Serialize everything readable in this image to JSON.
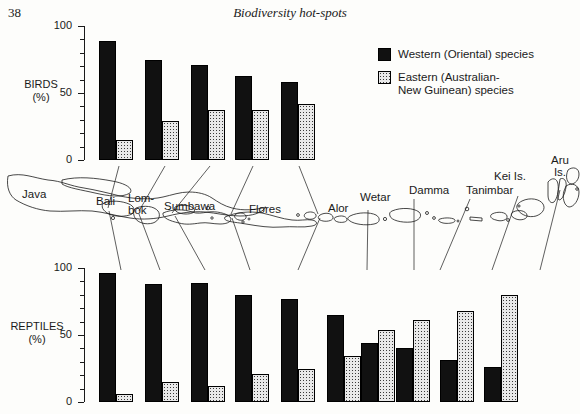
{
  "page": {
    "number": "38",
    "running_head": "Biodiversity hot-spots"
  },
  "legend": {
    "items": [
      {
        "key": "west",
        "label": "Western (Oriental) species",
        "swatch": "solid-black"
      },
      {
        "key": "east",
        "label": "Eastern (Australian-\nNew Guinean) species",
        "swatch": "stippled-grey"
      }
    ]
  },
  "axes": {
    "birds_title": "BIRDS\n(%)",
    "reptiles_title": "REPTILES\n(%)",
    "ticks": [
      "0",
      "50",
      "100"
    ]
  },
  "map": {
    "labels": [
      {
        "name": "Java",
        "text": "Java"
      },
      {
        "name": "Bali",
        "text": "Bali"
      },
      {
        "name": "Lombok",
        "text": "Lom-\nbok"
      },
      {
        "name": "Sumbawa",
        "text": "Sumbawa"
      },
      {
        "name": "Flores",
        "text": "Flores"
      },
      {
        "name": "Alor",
        "text": "Alor"
      },
      {
        "name": "Wetar",
        "text": "Wetar"
      },
      {
        "name": "Damma",
        "text": "Damma"
      },
      {
        "name": "Tanimbar",
        "text": "Tanimbar"
      },
      {
        "name": "Kei",
        "text": "Kei Is."
      },
      {
        "name": "Aru",
        "text": "Aru\nIs."
      }
    ]
  },
  "chart_data": [
    {
      "type": "bar",
      "name": "birds",
      "title": "BIRDS (%)",
      "xlabel": "",
      "ylabel": "BIRDS (%)",
      "ylim": [
        0,
        100
      ],
      "yticks": [
        0,
        50,
        100
      ],
      "grid": false,
      "legend_position": "top-right",
      "categories": [
        "Java",
        "Bali",
        "Lombok",
        "Sumbawa",
        "Flores"
      ],
      "series": [
        {
          "name": "Western (Oriental) species",
          "values": [
            89,
            75,
            71,
            63,
            58
          ]
        },
        {
          "name": "Eastern (Australian-New Guinean) species",
          "values": [
            15,
            29,
            37,
            37,
            42
          ]
        }
      ]
    },
    {
      "type": "bar",
      "name": "reptiles",
      "title": "REPTILES (%)",
      "xlabel": "",
      "ylabel": "REPTILES (%)",
      "ylim": [
        0,
        100
      ],
      "yticks": [
        0,
        50,
        100
      ],
      "grid": false,
      "legend_position": "none",
      "categories": [
        "Java",
        "Bali",
        "Lombok",
        "Sumbawa",
        "Flores",
        "Alor",
        "Wetar",
        "Damma",
        "Tanimbar",
        "Kei Is.",
        "Aru Is."
      ],
      "series": [
        {
          "name": "Western (Oriental) species",
          "values": [
            96,
            88,
            89,
            80,
            77,
            65,
            44,
            40,
            31,
            26
          ]
        },
        {
          "name": "Eastern (Australian-New Guinean) species",
          "values": [
            6,
            15,
            12,
            21,
            25,
            34,
            54,
            61,
            68,
            80
          ]
        }
      ],
      "note": "Ten bar groups plotted; bars correspond left-to-right to Java, Bali, Lombok, Sumbawa, Flores, Wetar, Damma, Tanimbar, Kei Is., Aru Is."
    }
  ]
}
